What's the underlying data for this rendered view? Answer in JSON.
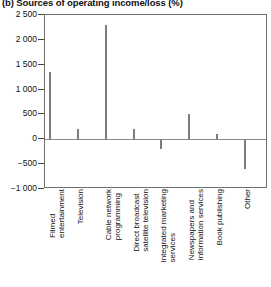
{
  "chart_data": {
    "type": "bar",
    "title": "(b) Sources of operating income/loss (%)",
    "xlabel": "",
    "ylabel": "",
    "ylim": [
      -1000,
      2500
    ],
    "grid": false,
    "legend": null,
    "yticks": [
      "2 500",
      "2 000",
      "1 500",
      "1 000",
      "500",
      "0",
      "-500",
      "-1 000"
    ],
    "ytick_values": [
      2500,
      2000,
      1500,
      1000,
      500,
      0,
      -500,
      -1000
    ],
    "categories": [
      "Filmed\nentertainment",
      "Television",
      "Cable network\nprogramming",
      "Direct broadcast\nsatellite television",
      "Integrated marketing\nservices",
      "Newspapers and\ninformation services",
      "Book publishing",
      "Other"
    ],
    "values": [
      1350,
      200,
      2300,
      210,
      -200,
      500,
      100,
      -600
    ],
    "bar_color": "#c3c3c3",
    "bar_edge_color": "#7d7d7d",
    "axis_color": "#444444"
  }
}
